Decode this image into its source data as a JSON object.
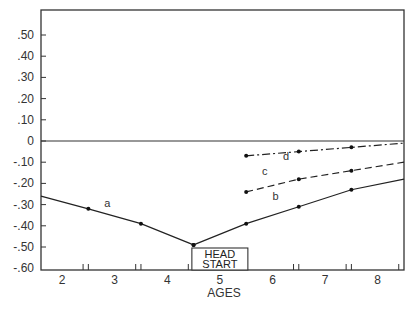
{
  "chart_data": {
    "type": "line",
    "title": "",
    "xlabel": "AGES",
    "ylabel": "",
    "xlim": [
      1.6,
      8.5
    ],
    "ylim": [
      -0.6,
      0.6
    ],
    "grid": false,
    "x_ticks": [
      "2",
      "3",
      "4",
      "5",
      "6",
      "7",
      "8"
    ],
    "y_ticks": [
      ".50",
      ".40",
      ".30",
      ".20",
      ".10",
      "0",
      "-.10",
      "-.20",
      "-.30",
      "-.40",
      "-.50",
      "-.60"
    ],
    "annotation": {
      "line1": "HEAD",
      "line2": "START",
      "x": 5
    },
    "reference_line": {
      "y": 0
    },
    "series": [
      {
        "name": "a",
        "style": "solid",
        "x": [
          1.6,
          2.5,
          3.5,
          4.5
        ],
        "values": [
          -0.26,
          -0.32,
          -0.39,
          -0.49
        ]
      },
      {
        "name": "b",
        "style": "solid",
        "x": [
          4.5,
          5.5,
          6.5,
          7.5,
          8.5
        ],
        "values": [
          -0.49,
          -0.39,
          -0.31,
          -0.23,
          -0.18
        ]
      },
      {
        "name": "c",
        "style": "dashed",
        "x": [
          5.5,
          6.5,
          7.5,
          8.5
        ],
        "values": [
          -0.24,
          -0.18,
          -0.14,
          -0.1
        ]
      },
      {
        "name": "d",
        "style": "dash-dot",
        "x": [
          5.5,
          6.5,
          7.5,
          8.5
        ],
        "values": [
          -0.07,
          -0.05,
          -0.03,
          -0.01
        ]
      }
    ]
  }
}
